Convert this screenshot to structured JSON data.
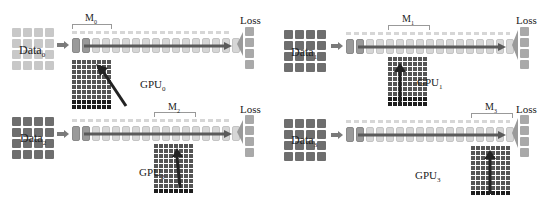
{
  "figure": {
    "caption_partial": "",
    "colors": {
      "data_grid_light": "#c8c8c8",
      "data_grid_dark": "#6e6e6e",
      "pipeline_block": "#d6d6d6",
      "pipeline_block_dark": "#9a9a9a",
      "pipeline_arrow": "#5a5a5a",
      "gpu_grid": "#555555",
      "gpu_arrow": "#222222",
      "loss_block": "#a9a9a9"
    }
  },
  "panels": [
    {
      "id": 0,
      "data_label": "Data",
      "data_sub": "0",
      "model_label": "M",
      "model_sub": "0",
      "gpu_label": "GPU",
      "gpu_sub": "0",
      "loss_label": "Loss",
      "data_style": "light"
    },
    {
      "id": 1,
      "data_label": "Data",
      "data_sub": "1",
      "model_label": "M",
      "model_sub": "1",
      "gpu_label": "GPU",
      "gpu_sub": "1",
      "loss_label": "Loss",
      "data_style": "dark"
    },
    {
      "id": 2,
      "data_label": "Data",
      "data_sub": "2",
      "model_label": "M",
      "model_sub": "2",
      "gpu_label": "GPU",
      "gpu_sub": "2",
      "loss_label": "Loss",
      "data_style": "dark"
    },
    {
      "id": 3,
      "data_label": "Data",
      "data_sub": "3",
      "model_label": "M",
      "model_sub": "3",
      "gpu_label": "GPU",
      "gpu_sub": "3",
      "loss_label": "Loss",
      "data_style": "dark"
    }
  ]
}
